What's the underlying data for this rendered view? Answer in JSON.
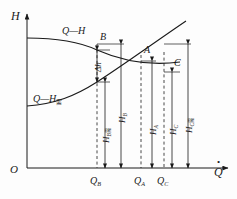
{
  "figure": {
    "type": "diagram",
    "background_color": "#fdfdfd",
    "line_color": "#1a1a1a"
  },
  "axes": {
    "y_label": "H",
    "x_label_base": "Q",
    "x_label_accent": "dot",
    "origin_label": "O",
    "x_axis": {
      "x1": 27,
      "y1": 168,
      "x2": 228,
      "y2": 168
    },
    "y_axis": {
      "x1": 27,
      "y1": 168,
      "x2": 27,
      "y2": 14
    }
  },
  "curves": [
    {
      "name": "pump-characteristic-curve",
      "label": "Q—H",
      "label_x": 62,
      "label_y": 26,
      "path": "M 27,38 C 60,38 80,42 97,50 C 122,61 150,66 180,62",
      "description": "descending pump head curve"
    },
    {
      "name": "system-resistance-curve",
      "label_prefix": "Q—H",
      "label_subscript": "需",
      "label": "Q—H需",
      "label_x": 33,
      "label_y": 94,
      "path": "M 27,106 C 55,104 75,96 97,82 C 125,64 155,42 186,21",
      "description": "rising required-head / system curve"
    }
  ],
  "points": [
    {
      "name": "point-b",
      "label": "B",
      "x": 97,
      "y": 50,
      "label_x": 100,
      "label_y": 32
    },
    {
      "name": "point-a",
      "label": "A",
      "x": 141,
      "y": 61,
      "label_x": 144,
      "label_y": 45
    },
    {
      "name": "point-c",
      "label": "C",
      "x": 164,
      "y": 58,
      "label_x": 174,
      "label_y": 58
    }
  ],
  "x_ticks": [
    {
      "name": "tick-qb",
      "base": "Q",
      "sub": "B",
      "x": 97,
      "label_x": 90,
      "label_y": 176
    },
    {
      "name": "tick-qa",
      "base": "Q",
      "sub": "A",
      "x": 141,
      "label_x": 134,
      "label_y": 176
    },
    {
      "name": "tick-qc",
      "base": "Q",
      "sub": "C",
      "x": 164,
      "label_x": 157,
      "label_y": 176
    }
  ],
  "dashed_verticals": [
    {
      "name": "dashed-qb",
      "x": 97,
      "y_top": 44,
      "y_bottom": 168
    },
    {
      "name": "dashed-qa",
      "x": 141,
      "y_top": 55,
      "y_bottom": 168
    },
    {
      "name": "dashed-qc",
      "x": 164,
      "y_top": 52,
      "y_bottom": 168
    }
  ],
  "dimensions": [
    {
      "name": "dim-delta-h",
      "base": "Δh",
      "sub": "",
      "x": 97,
      "y_top": 50,
      "y_bottom": 82,
      "label_x": 94,
      "label_y": 72,
      "rotated": true,
      "meaning": "head difference between pump curve and system curve at Q_B"
    },
    {
      "name": "dim-hb-required",
      "base": "H",
      "sub": "B",
      "sub_cjk": "需",
      "x": 105,
      "y_top": 82,
      "y_bottom": 168,
      "label_x": 102,
      "label_y": 143,
      "rotated": true,
      "meaning": "required head at Q_B"
    },
    {
      "name": "dim-hb",
      "base": "H",
      "sub": "B",
      "sub_cjk": "",
      "x": 121,
      "y_top": 44,
      "y_bottom": 168,
      "label_x": 118,
      "label_y": 123,
      "rotated": true,
      "meaning": "pump head at Q_B"
    },
    {
      "name": "dim-ha",
      "base": "H",
      "sub": "A",
      "sub_cjk": "",
      "x": 152,
      "y_top": 61,
      "y_bottom": 168,
      "label_x": 149,
      "label_y": 135,
      "rotated": true,
      "meaning": "head at operating point A"
    },
    {
      "name": "dim-hc",
      "base": "H",
      "sub": "C",
      "sub_cjk": "",
      "x": 172,
      "y_top": 72,
      "y_bottom": 168,
      "label_x": 169,
      "label_y": 135,
      "rotated": true,
      "meaning": "pump head at Q_C"
    },
    {
      "name": "dim-hc-required",
      "base": "H",
      "sub": "C",
      "sub_cjk": "需",
      "x": 188,
      "y_top": 44,
      "y_bottom": 168,
      "label_x": 185,
      "label_y": 133,
      "rotated": true,
      "meaning": "required head at Q_C"
    }
  ],
  "leader_lines": [
    {
      "name": "leader-b-top",
      "x1": 97,
      "y1": 44,
      "x2": 124,
      "y2": 44
    },
    {
      "name": "leader-delta-top",
      "x1": 97,
      "y1": 50,
      "x2": 110,
      "y2": 50
    },
    {
      "name": "leader-delta-bottom",
      "x1": 97,
      "y1": 82,
      "x2": 110,
      "y2": 82
    },
    {
      "name": "leader-a",
      "x1": 141,
      "y1": 61,
      "x2": 156,
      "y2": 61
    },
    {
      "name": "leader-c",
      "x1": 164,
      "y1": 72,
      "x2": 180,
      "y2": 72
    },
    {
      "name": "leader-hc-top",
      "x1": 164,
      "y1": 44,
      "x2": 191,
      "y2": 44
    }
  ]
}
